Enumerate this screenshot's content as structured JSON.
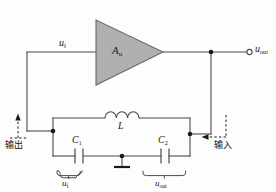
{
  "diagram": {
    "type": "circuit-schematic",
    "colors": {
      "wire": "#4a4a4a",
      "amplifier_fill": "#b0b0b0",
      "amplifier_stroke": "#6a6a6a",
      "node_dot": "#1a1a1a",
      "dashed_arrow": "#1a1a1a",
      "text": "#1a1a1a",
      "background": "#fdfdfd"
    },
    "amplifier": {
      "label_main": "A",
      "label_sub": "u",
      "name": "voltage-amplifier"
    },
    "labels": {
      "feedback_voltage_top": {
        "main": "u",
        "sub": "f"
      },
      "output_terminal": {
        "main": "u",
        "sub": "out"
      },
      "inductor": "L",
      "capacitor_1": {
        "main": "C",
        "sub": "1"
      },
      "capacitor_2": {
        "main": "C",
        "sub": "2"
      },
      "brace_left_voltage": {
        "main": "u",
        "sub": "f"
      },
      "brace_right_voltage": {
        "main": "u",
        "sub": "out"
      },
      "chinese_output": "输出",
      "chinese_input": "输入"
    },
    "components": [
      {
        "name": "inductor-L",
        "type": "inductor",
        "label": "L",
        "turns": 3
      },
      {
        "name": "capacitor-C1",
        "type": "capacitor",
        "label": "C1"
      },
      {
        "name": "capacitor-C2",
        "type": "capacitor",
        "label": "C2"
      },
      {
        "name": "ground",
        "type": "ground"
      },
      {
        "name": "output-terminal",
        "type": "open-terminal"
      }
    ],
    "nodes": [
      {
        "name": "node-amp-output",
        "x": 211,
        "y": 52
      },
      {
        "name": "node-feedback-left",
        "x": 53,
        "y": 131
      },
      {
        "name": "node-tank-right",
        "x": 190,
        "y": 134
      },
      {
        "name": "node-ground-tap",
        "x": 122,
        "y": 156
      }
    ],
    "annotations": [
      {
        "name": "arrow-output-up",
        "direction": "up",
        "label": "输出"
      },
      {
        "name": "arrow-input-left",
        "direction": "left",
        "label": "输入"
      }
    ]
  }
}
